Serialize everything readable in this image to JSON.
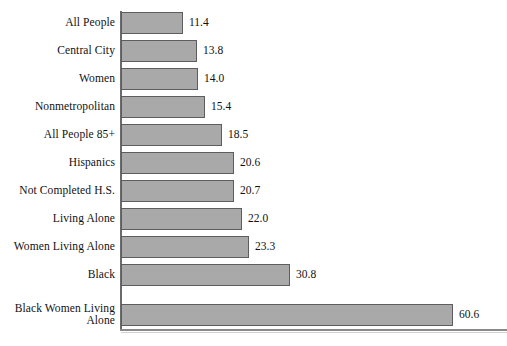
{
  "chart_data": {
    "type": "bar",
    "orientation": "horizontal",
    "title": "",
    "subtitle": "",
    "xlabel": "",
    "ylabel": "",
    "grid": false,
    "legend": false,
    "axis_visible": {
      "y_spine": true,
      "x_baseline": true,
      "ticks": false,
      "tick_labels": false
    },
    "value_label_format": "one-decimal",
    "xlim": [
      0,
      60.6
    ],
    "categories": [
      "All People",
      "Central City",
      "Women",
      "Nonmetropolitan",
      "All People 85+",
      "Hispanics",
      "Not Completed H.S.",
      "Living Alone",
      "Women Living Alone",
      "Black",
      "Black Women Living\nAlone"
    ],
    "values": [
      11.4,
      13.8,
      14.0,
      15.4,
      18.5,
      20.6,
      20.7,
      22.0,
      23.3,
      30.8,
      60.6
    ],
    "value_labels": [
      "11.4",
      "13.8",
      "14.0",
      "15.4",
      "18.5",
      "20.6",
      "20.7",
      "22.0",
      "23.3",
      "30.8",
      "60.6"
    ],
    "colors": {
      "bar_fill": "#a9a9a9",
      "bar_stroke": "#5d5d5d",
      "axis": "#6b6b6b",
      "baseline": "#8a8a8a",
      "text": "#111111",
      "background": "#ffffff"
    }
  }
}
